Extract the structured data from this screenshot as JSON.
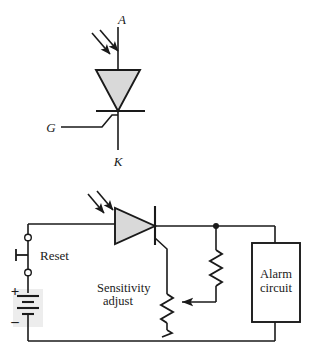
{
  "figure": {
    "type": "electronic-schematic",
    "colors": {
      "line": "#1a1a1a",
      "device_fill": "#d9d9d9",
      "shade_block": "#ededed",
      "background": "#ffffff"
    }
  },
  "symbol": {
    "name": "lascr-symbol",
    "terminals": {
      "anode": "A",
      "gate": "G",
      "cathode": "K"
    },
    "light_arrows": "two-incident-light-arrows"
  },
  "circuit": {
    "name": "light-activated-alarm-circuit",
    "labels": {
      "reset": "Reset",
      "sensitivity_line1": "Sensitivity",
      "sensitivity_line2": "adjust",
      "alarm_line1": "Alarm",
      "alarm_line2": "circuit",
      "battery_plus": "+",
      "battery_minus": "–"
    },
    "components": [
      {
        "id": "reset-switch",
        "label": "Reset",
        "type": "normally-closed-pushbutton"
      },
      {
        "id": "battery",
        "label": "+ –",
        "type": "dc-source"
      },
      {
        "id": "lascr",
        "label": "",
        "type": "light-activated-scr"
      },
      {
        "id": "sensitivity-pot",
        "label": "Sensitivity adjust",
        "type": "potentiometer"
      },
      {
        "id": "load-resistor",
        "label": "",
        "type": "resistor"
      },
      {
        "id": "alarm-circuit",
        "label": "Alarm circuit",
        "type": "block"
      }
    ]
  }
}
